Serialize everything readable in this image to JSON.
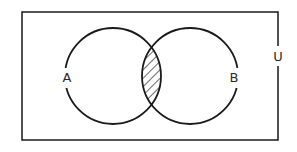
{
  "diagram": {
    "type": "venn",
    "universe_label": "U",
    "sets": [
      {
        "label": "A"
      },
      {
        "label": "B"
      }
    ],
    "shaded_region": "A ∩ B",
    "stroke_color": "#1a1a1a",
    "background": "#ffffff"
  }
}
